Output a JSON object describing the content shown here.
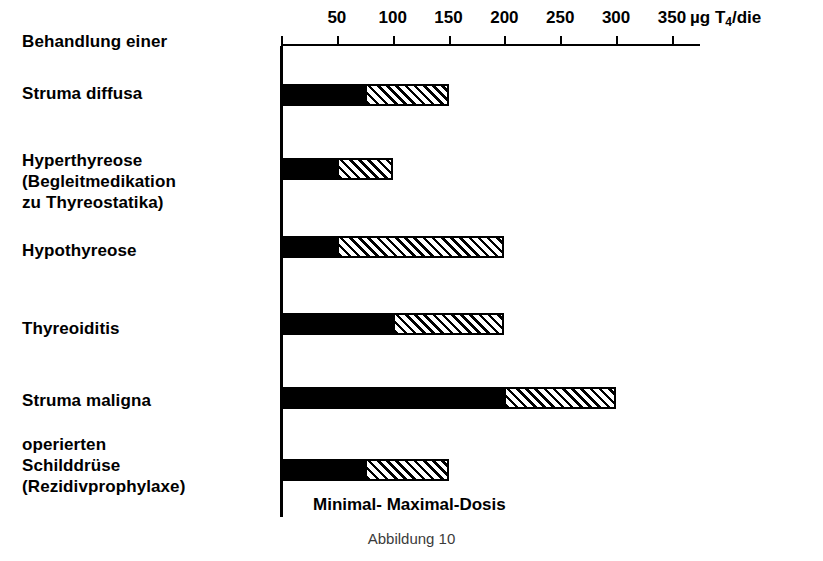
{
  "chart_data": {
    "type": "bar",
    "orientation": "horizontal",
    "title": "Behandlung einer",
    "caption": "Abbildung 10",
    "xlabel": "µg T4/die",
    "xlabel_parts": {
      "prefix": "µg T",
      "sub": "4",
      "suffix": "/die"
    },
    "ylabel": "",
    "xlim": [
      0,
      375
    ],
    "xticks": [
      50,
      100,
      150,
      200,
      250,
      300,
      350
    ],
    "xtick_labels": [
      "50",
      "100",
      "150",
      "200",
      "250",
      "300",
      "350"
    ],
    "grid": false,
    "legend_position": "bottom-inline",
    "legend_text": "Minimal- Maximal-Dosis",
    "series": [
      {
        "name": "Minimal-Dosis",
        "style": "solid-black",
        "values": [
          75,
          50,
          50,
          100,
          200,
          75
        ]
      },
      {
        "name": "Maximal-Dosis",
        "style": "hatched",
        "values": [
          150,
          100,
          200,
          200,
          300,
          150
        ]
      }
    ],
    "categories": [
      "Struma diffusa",
      "Hyperthyreose\n(Begleitmedikation\nzu Thyreostatika)",
      "Hypothyreose",
      "Thyreoiditis",
      "Struma maligna",
      "operierten\nSchilddrüse\n(Rezidivprophylaxe)"
    ],
    "bars": [
      {
        "label": "Struma diffusa",
        "min": 75,
        "max": 150
      },
      {
        "label": "Hyperthyreose (Begleitmedikation zu Thyreostatika)",
        "min": 50,
        "max": 100
      },
      {
        "label": "Hypothyreose",
        "min": 50,
        "max": 200
      },
      {
        "label": "Thyreoiditis",
        "min": 100,
        "max": 200
      },
      {
        "label": "Struma maligna",
        "min": 200,
        "max": 300
      },
      {
        "label": "operierten Schilddrüse (Rezidivprophylaxe)",
        "min": 75,
        "max": 150
      }
    ]
  },
  "labels": {
    "intro": "Behandlung einer",
    "cat0": "Struma diffusa",
    "cat1": "Hyperthyreose\n(Begleitmedikation\nzu Thyreostatika)",
    "cat2": "Hypothyreose",
    "cat3": "Thyreoiditis",
    "cat4": "Struma maligna",
    "cat5": "operierten\nSchilddrüse\n(Rezidivprophylaxe)"
  },
  "axis": {
    "tick0": "50",
    "tick1": "100",
    "tick2": "150",
    "tick3": "200",
    "tick4": "250",
    "tick5": "300",
    "tick6": "350",
    "unit_prefix": "µg T",
    "unit_sub": "4",
    "unit_suffix": "/die"
  },
  "legend": {
    "text": "Minimal- Maximal-Dosis"
  },
  "caption": {
    "text": "Abbildung 10"
  },
  "colors": {
    "ink": "#000000",
    "background": "#ffffff",
    "caption": "#3b3b3b"
  }
}
